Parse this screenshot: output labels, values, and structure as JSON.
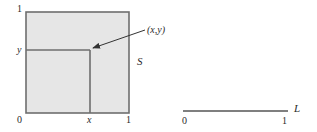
{
  "figure": {
    "square": {
      "name": "S",
      "fill": "#e6e6e6",
      "stroke": "#6e6e6e",
      "tick_labels": {
        "origin": "0",
        "x_one": "1",
        "y_one": "1",
        "x_var": "x",
        "y_var": "y"
      },
      "point_label": "(x,y)"
    },
    "segment": {
      "name": "L",
      "stroke": "#555555",
      "start_label": "0",
      "end_label": "1"
    },
    "colors": {
      "text": "#2a2a2a",
      "arrow": "#333333",
      "background": "#ffffff"
    }
  }
}
